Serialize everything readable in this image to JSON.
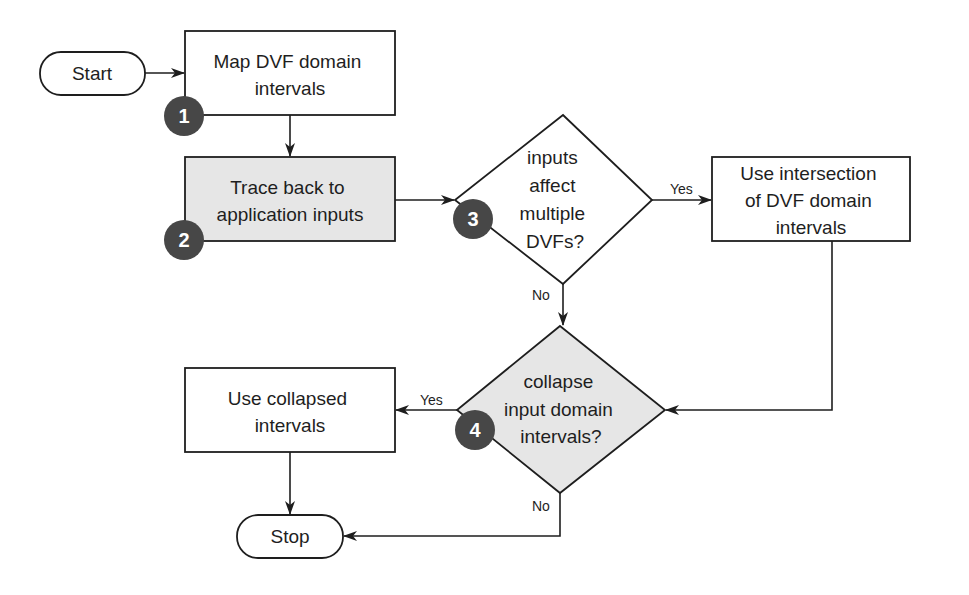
{
  "colors": {
    "background": "#ffffff",
    "stroke": "#1e1e1e",
    "shaded_fill": "#e6e6e6",
    "plain_fill": "#ffffff",
    "badge_fill": "#474747",
    "badge_text": "#ffffff"
  },
  "nodes": {
    "start": {
      "label": "Start"
    },
    "map_intervals": {
      "lines": [
        "Map DVF domain",
        "intervals"
      ],
      "badge": "1"
    },
    "trace_back": {
      "lines": [
        "Trace back to",
        "application inputs"
      ],
      "badge": "2"
    },
    "decision_multiple": {
      "lines": [
        "inputs",
        "affect",
        "multiple",
        "DVFs?"
      ],
      "badge": "3"
    },
    "use_intersection": {
      "lines": [
        "Use intersection",
        "of DVF domain",
        "intervals"
      ]
    },
    "decision_collapse": {
      "lines": [
        "collapse",
        "input domain",
        "intervals?"
      ],
      "badge": "4"
    },
    "use_collapsed": {
      "lines": [
        "Use collapsed",
        "intervals"
      ]
    },
    "stop": {
      "label": "Stop"
    }
  },
  "edges": {
    "d3_yes": "Yes",
    "d3_no": "No",
    "d4_yes": "Yes",
    "d4_no": "No"
  }
}
